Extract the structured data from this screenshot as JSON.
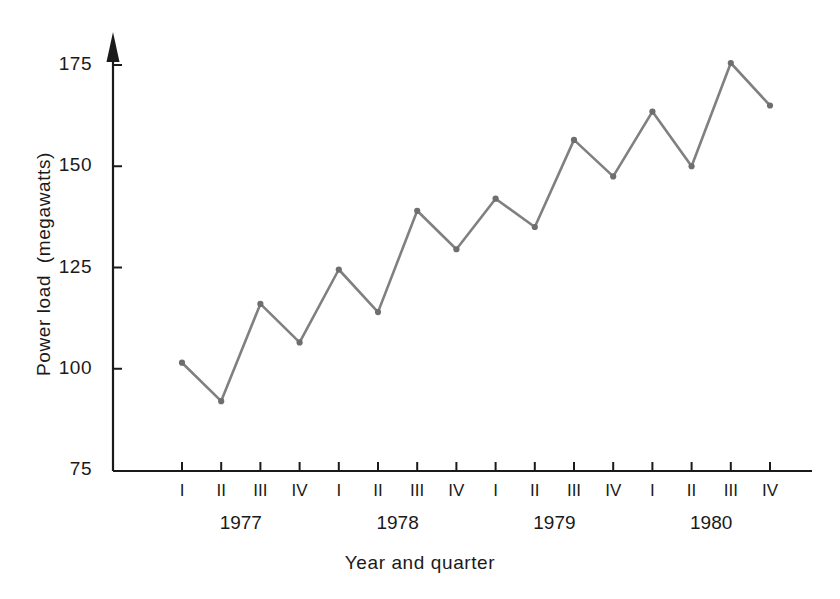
{
  "chart_data": {
    "type": "line",
    "title": "",
    "xlabel": "Year and quarter",
    "ylabel": "Power load  (megawatts)",
    "ylim": [
      75,
      175
    ],
    "ytick_labels": [
      "175",
      "150",
      "125",
      "100",
      "75"
    ],
    "ytick_values": [
      175,
      150,
      125,
      100,
      75
    ],
    "grid": false,
    "legend": "none",
    "categories": [
      "1977 I",
      "1977 II",
      "1977 III",
      "1977 IV",
      "1978 I",
      "1978 II",
      "1978 III",
      "1978 IV",
      "1979 I",
      "1979 II",
      "1979 III",
      "1979 IV",
      "1980 I",
      "1980 II",
      "1980 III",
      "1980 IV"
    ],
    "quarter_labels": [
      "I",
      "II",
      "III",
      "IV",
      "I",
      "II",
      "III",
      "IV",
      "I",
      "II",
      "III",
      "IV",
      "I",
      "II",
      "III",
      "IV"
    ],
    "year_labels": [
      "1977",
      "1978",
      "1979",
      "1980"
    ],
    "values": [
      101.5,
      92,
      116,
      106.5,
      124.5,
      114,
      139,
      129.5,
      142,
      135,
      156.5,
      147.5,
      163.5,
      150,
      175.5,
      165
    ],
    "series": [
      {
        "name": "Power load",
        "values": [
          101.5,
          92,
          116,
          106.5,
          124.5,
          114,
          139,
          129.5,
          142,
          135,
          156.5,
          147.5,
          163.5,
          150,
          175.5,
          165
        ]
      }
    ],
    "line_color": "#808080",
    "marker_color": "#6e6e6e",
    "axis_color": "#1a1a1a"
  }
}
